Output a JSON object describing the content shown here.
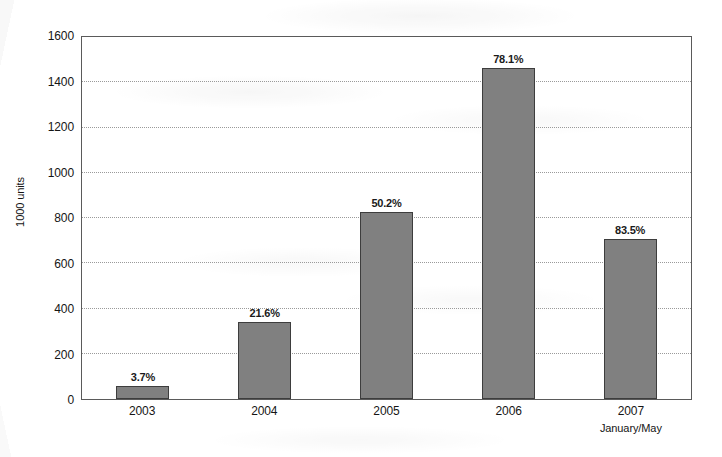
{
  "chart_data": {
    "type": "bar",
    "title": "",
    "xlabel": "",
    "ylabel": "1000 units",
    "ylim": [
      0,
      1600
    ],
    "yticks": [
      0,
      200,
      400,
      600,
      800,
      1000,
      1200,
      1400,
      1600
    ],
    "ytick_labels": [
      "0",
      "200",
      "400",
      "600",
      "800",
      "1000",
      "1200",
      "1400",
      "1600"
    ],
    "grid": true,
    "legend": "none",
    "categories": [
      "2003",
      "2004",
      "2005",
      "2006",
      "2007"
    ],
    "category_sublabels": [
      "",
      "",
      "",
      "",
      "January/May"
    ],
    "values": [
      57,
      340,
      820,
      1455,
      705
    ],
    "data_labels": [
      "3.7%",
      "21.6%",
      "50.2%",
      "78.1%",
      "83.5%"
    ],
    "series": [
      {
        "name": "units",
        "values": [
          57,
          340,
          820,
          1455,
          705
        ],
        "labels": [
          "3.7%",
          "21.6%",
          "50.2%",
          "78.1%",
          "83.5%"
        ]
      }
    ],
    "colors": {
      "bar_fill": "#808080",
      "bar_outline": "#3d3d3d",
      "gridline": "#9a9a9a",
      "frame": "#5a5a5a",
      "text": "#151515",
      "background": "#ffffff"
    }
  }
}
